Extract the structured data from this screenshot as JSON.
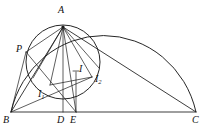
{
  "figure": {
    "background_color": "#ffffff",
    "stroke_color": "#1a1a1a",
    "width": 213,
    "height": 134
  },
  "labels": {
    "A": "A",
    "B": "B",
    "C": "C",
    "D": "D",
    "E": "E",
    "P": "P",
    "I": "I",
    "I1_main": "I",
    "I1_sub": "1",
    "I2_main": "I",
    "I2_sub": "2"
  },
  "points": {
    "A": {
      "name": "A",
      "x": 63,
      "y": 27
    },
    "B": {
      "name": "B",
      "x": 11,
      "y": 112
    },
    "C": {
      "name": "C",
      "x": 196,
      "y": 112
    },
    "D": {
      "name": "D",
      "x": 63,
      "y": 112
    },
    "E": {
      "name": "E",
      "x": 76,
      "y": 112
    },
    "P": {
      "name": "P",
      "x": 26,
      "y": 52
    },
    "I": {
      "name": "I",
      "x": 76,
      "y": 72
    },
    "I1": {
      "name": "I1",
      "x": 50,
      "y": 85
    },
    "I2": {
      "name": "I2",
      "x": 92,
      "y": 77
    }
  },
  "label_positions": {
    "A": {
      "x": 58,
      "y": 5
    },
    "B": {
      "x": 4,
      "y": 114
    },
    "C": {
      "x": 192,
      "y": 114
    },
    "D": {
      "x": 57,
      "y": 114
    },
    "E": {
      "x": 70,
      "y": 114
    },
    "P": {
      "x": 17,
      "y": 45
    },
    "I": {
      "x": 78,
      "y": 65
    },
    "I1": {
      "x": 39,
      "y": 89
    },
    "I2": {
      "x": 95,
      "y": 74
    }
  },
  "shapes": {
    "circumcircle_arc": {
      "name": "circumcircle-arc",
      "from_x": 11,
      "from_y": 112,
      "to_x": 196,
      "to_y": 112,
      "rx": 93,
      "ry": 99,
      "description": "large arc over triangle from B to C"
    },
    "inner_circle": {
      "name": "inner-circle",
      "cx": 63,
      "cy": 62,
      "r": 37
    },
    "triangle_sides": [
      {
        "name": "side-BC",
        "x1": 11,
        "y1": 112,
        "x2": 196,
        "y2": 112
      },
      {
        "name": "side-AB",
        "x1": 63,
        "y1": 27,
        "x2": 11,
        "y2": 112
      },
      {
        "name": "side-AC",
        "x1": 63,
        "y1": 27,
        "x2": 196,
        "y2": 112
      }
    ],
    "cevians_from_A": [
      {
        "name": "cevian-A-to-B",
        "x2": 11,
        "y2": 112
      },
      {
        "name": "cevian-A-to-I1",
        "x2": 50,
        "y2": 85
      },
      {
        "name": "cevian-A-to-D",
        "x2": 63,
        "y2": 112
      },
      {
        "name": "cevian-A-to-E",
        "x2": 76,
        "y2": 112
      },
      {
        "name": "cevian-A-to-I2",
        "x2": 92,
        "y2": 77
      },
      {
        "name": "cevian-A-to-P",
        "x2": 26,
        "y2": 52
      },
      {
        "name": "cevian-A-to-C",
        "x2": 196,
        "y2": 112
      }
    ],
    "chords_from_B": [
      {
        "name": "chord-B-to-P",
        "x2": 26,
        "y2": 52
      },
      {
        "name": "chord-B-to-I2",
        "x2": 92,
        "y2": 77
      }
    ],
    "other_segments": [
      {
        "name": "segment-P-to-E",
        "x1": 26,
        "y1": 52,
        "x2": 76,
        "y2": 112
      },
      {
        "name": "segment-I-to-E",
        "x1": 76,
        "y1": 72,
        "x2": 76,
        "y2": 112
      },
      {
        "name": "segment-I1-to-I2",
        "x1": 50,
        "y1": 85,
        "x2": 92,
        "y2": 77
      },
      {
        "name": "segment-A-to-D-altitude",
        "x1": 63,
        "y1": 27,
        "x2": 63,
        "y2": 112
      }
    ]
  }
}
